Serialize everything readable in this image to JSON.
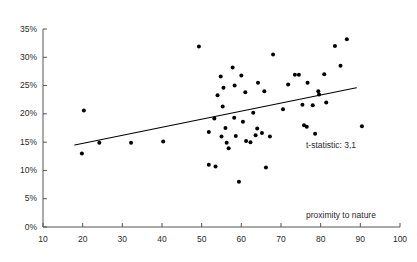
{
  "chart_data": {
    "type": "scatter",
    "title": "",
    "subtitle": "",
    "xlabel": "proximity to nature",
    "ylabel": "",
    "xlim": [
      10,
      100
    ],
    "ylim": [
      0,
      35
    ],
    "x_ticks": [
      10,
      20,
      30,
      40,
      50,
      60,
      70,
      80,
      90,
      100
    ],
    "x_tick_labels": [
      "10",
      "20",
      "30",
      "40",
      "50",
      "60",
      "70",
      "80",
      "90",
      "100"
    ],
    "y_ticks": [
      0,
      5,
      10,
      15,
      20,
      25,
      30,
      35
    ],
    "y_tick_labels": [
      "0%",
      "5%",
      "10%",
      "15%",
      "20%",
      "25%",
      "30%",
      "35%"
    ],
    "grid": false,
    "legend": null,
    "marker_color": "#000000",
    "marker_size_px": 3.2,
    "axis_color": "#555555",
    "points": [
      {
        "x": 19.8,
        "y": 13.0
      },
      {
        "x": 20.3,
        "y": 20.6
      },
      {
        "x": 24.2,
        "y": 14.9
      },
      {
        "x": 32.2,
        "y": 14.9
      },
      {
        "x": 40.3,
        "y": 15.1
      },
      {
        "x": 49.3,
        "y": 31.9
      },
      {
        "x": 51.8,
        "y": 16.8
      },
      {
        "x": 51.8,
        "y": 11.0
      },
      {
        "x": 53.5,
        "y": 10.7
      },
      {
        "x": 53.2,
        "y": 19.2
      },
      {
        "x": 54.0,
        "y": 23.3
      },
      {
        "x": 54.8,
        "y": 26.6
      },
      {
        "x": 55.5,
        "y": 24.6
      },
      {
        "x": 55.3,
        "y": 21.3
      },
      {
        "x": 56.0,
        "y": 17.5
      },
      {
        "x": 55.0,
        "y": 16.0
      },
      {
        "x": 56.3,
        "y": 14.9
      },
      {
        "x": 56.8,
        "y": 13.9
      },
      {
        "x": 57.8,
        "y": 28.2
      },
      {
        "x": 58.2,
        "y": 19.3
      },
      {
        "x": 58.3,
        "y": 25.0
      },
      {
        "x": 58.6,
        "y": 16.1
      },
      {
        "x": 59.4,
        "y": 8.0
      },
      {
        "x": 60.0,
        "y": 26.8
      },
      {
        "x": 60.4,
        "y": 18.6
      },
      {
        "x": 61.2,
        "y": 15.2
      },
      {
        "x": 61.0,
        "y": 23.8
      },
      {
        "x": 62.3,
        "y": 15.0
      },
      {
        "x": 63.0,
        "y": 20.2
      },
      {
        "x": 63.6,
        "y": 16.2
      },
      {
        "x": 64.0,
        "y": 17.4
      },
      {
        "x": 64.2,
        "y": 25.5
      },
      {
        "x": 65.2,
        "y": 16.6
      },
      {
        "x": 65.8,
        "y": 24.0
      },
      {
        "x": 66.2,
        "y": 10.5
      },
      {
        "x": 67.2,
        "y": 16.0
      },
      {
        "x": 68.0,
        "y": 30.5
      },
      {
        "x": 70.5,
        "y": 20.8
      },
      {
        "x": 71.8,
        "y": 25.2
      },
      {
        "x": 73.5,
        "y": 26.9
      },
      {
        "x": 74.5,
        "y": 26.9
      },
      {
        "x": 75.4,
        "y": 21.6
      },
      {
        "x": 75.8,
        "y": 18.0
      },
      {
        "x": 76.5,
        "y": 17.7
      },
      {
        "x": 76.7,
        "y": 25.5
      },
      {
        "x": 78.0,
        "y": 21.5
      },
      {
        "x": 78.6,
        "y": 16.5
      },
      {
        "x": 79.4,
        "y": 24.0
      },
      {
        "x": 79.6,
        "y": 23.4
      },
      {
        "x": 80.9,
        "y": 27.0
      },
      {
        "x": 81.4,
        "y": 22.0
      },
      {
        "x": 83.6,
        "y": 32.0
      },
      {
        "x": 85.0,
        "y": 28.5
      },
      {
        "x": 86.6,
        "y": 33.2
      },
      {
        "x": 90.4,
        "y": 17.8
      }
    ],
    "trendline": {
      "x_start": 18.0,
      "y_start": 14.5,
      "x_end": 89.0,
      "y_end": 24.6,
      "color": "#000000",
      "width_px": 1.1
    },
    "annotations": [
      {
        "text": "t-statistic: 3,1",
        "x_px": 306,
        "y_px": 141
      }
    ]
  }
}
